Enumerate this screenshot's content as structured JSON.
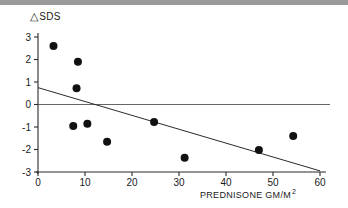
{
  "chart_data": {
    "type": "scatter",
    "title": "",
    "xlabel": "PREDNISONE GM/M",
    "xlabel_superscript": "2",
    "ylabel": "SDS",
    "ylabel_prefix_symbol": "triangle-delta",
    "xlim": [
      0,
      60
    ],
    "ylim": [
      -3,
      3
    ],
    "xticks": [
      0,
      10,
      20,
      30,
      40,
      50,
      60
    ],
    "yticks": [
      3,
      2,
      1,
      0,
      -1,
      -2,
      -3
    ],
    "ytick_labels": [
      "3",
      "2",
      "1",
      "0",
      "-1",
      "-2",
      "-3"
    ],
    "xtick_labels": [
      "0",
      "10",
      "20",
      "30",
      "40",
      "50",
      "60"
    ],
    "grid": false,
    "legend": null,
    "zero_reference_line": {
      "y": 0,
      "from_x": 0,
      "to_x": 60,
      "color": "#555555"
    },
    "points": [
      {
        "x": 3.3,
        "y": 2.6
      },
      {
        "x": 8.5,
        "y": 1.9
      },
      {
        "x": 8.2,
        "y": 0.72
      },
      {
        "x": 7.5,
        "y": -0.95
      },
      {
        "x": 10.5,
        "y": -0.85
      },
      {
        "x": 14.7,
        "y": -1.65
      },
      {
        "x": 24.7,
        "y": -0.78
      },
      {
        "x": 31.2,
        "y": -2.37
      },
      {
        "x": 47.0,
        "y": -2.02
      },
      {
        "x": 54.3,
        "y": -1.4
      }
    ],
    "marker": {
      "shape": "circle",
      "color": "#111111",
      "radius_px": 4.0
    },
    "regression_line": {
      "x_start": 0,
      "y_start": 0.75,
      "x_end": 60,
      "y_end": -2.95,
      "color": "#2b2b2b"
    }
  },
  "figure": {
    "background_color": "#ffffff",
    "axis_color": "#2b2b2b",
    "top_bar_color": "#9a9a9a"
  }
}
